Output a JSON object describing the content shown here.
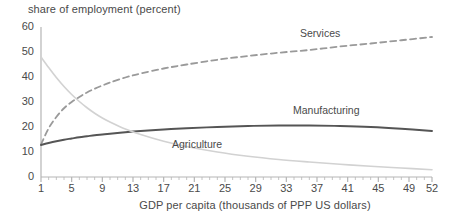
{
  "chart_data": {
    "type": "line",
    "title": "",
    "ylabel": "share of employment (percent)",
    "xlabel": "GDP per capita (thousands of PPP US dollars)",
    "xlim": [
      1,
      52
    ],
    "ylim": [
      0,
      60
    ],
    "grid": false,
    "legend_position": "inline-annotations",
    "yticks": [
      0,
      10,
      20,
      30,
      40,
      50,
      60
    ],
    "xticks": [
      1,
      5,
      9,
      13,
      17,
      21,
      25,
      29,
      33,
      37,
      41,
      45,
      49,
      52
    ],
    "x": [
      1,
      2,
      3,
      4,
      5,
      6,
      7,
      8,
      9,
      10,
      12,
      14,
      17,
      20,
      24,
      28,
      32,
      36,
      40,
      44,
      48,
      52
    ],
    "series": [
      {
        "name": "Services",
        "style": "dashed",
        "color": "#9a9a9a",
        "label_x": 33,
        "label_y": 57,
        "values": [
          13.0,
          19.5,
          24.0,
          27.5,
          30.0,
          32.0,
          33.8,
          35.3,
          36.6,
          37.8,
          39.8,
          41.4,
          43.4,
          45.0,
          46.9,
          48.4,
          49.7,
          50.8,
          52.2,
          53.4,
          54.7,
          56.0
        ]
      },
      {
        "name": "Manufacturing",
        "style": "solid",
        "color": "#555555",
        "label_x": 33,
        "label_y": 27,
        "values": [
          12.8,
          13.6,
          14.3,
          14.9,
          15.4,
          15.9,
          16.3,
          16.7,
          17.0,
          17.3,
          17.9,
          18.4,
          19.0,
          19.5,
          20.0,
          20.4,
          20.6,
          20.6,
          20.4,
          20.0,
          19.3,
          18.4
        ]
      },
      {
        "name": "Agriculture",
        "style": "solid",
        "color": "#d2d2d2",
        "label_x": 17,
        "label_y": 14,
        "values": [
          48.0,
          43.8,
          39.8,
          36.2,
          33.0,
          30.2,
          27.7,
          25.5,
          23.6,
          22.0,
          19.2,
          17.0,
          14.3,
          12.2,
          10.0,
          8.3,
          7.0,
          6.0,
          5.1,
          4.3,
          3.6,
          2.9
        ]
      }
    ],
    "annotations": [
      {
        "text": "Services",
        "x": 300,
        "y": 27
      },
      {
        "text": "Manufacturing",
        "x": 293,
        "y": 104
      },
      {
        "text": "Agriculture",
        "x": 172,
        "y": 138
      }
    ]
  }
}
